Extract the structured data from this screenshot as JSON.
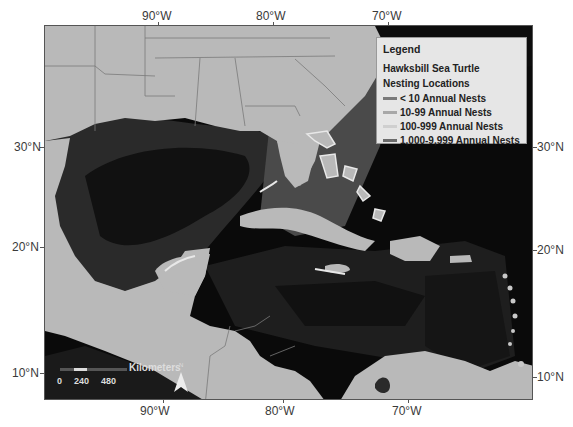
{
  "map": {
    "title": "Hawksbill Sea Turtle Nesting Locations",
    "colors": {
      "land": "#b9b9b9",
      "shallow_water": "#4a4a4a",
      "mid_water": "#2a2a2a",
      "deep_water": "#0a0a0a",
      "border": "#7a7a7a",
      "nest_highlight": "#e8e8e8"
    }
  },
  "axes": {
    "top_labels": [
      {
        "label": "90°W",
        "x": 158
      },
      {
        "label": "80°W",
        "x": 273
      },
      {
        "label": "70°W",
        "x": 388
      }
    ],
    "bottom_labels": [
      {
        "label": "90°W",
        "x": 163
      },
      {
        "label": "80°W",
        "x": 283
      },
      {
        "label": "70°W",
        "x": 408
      }
    ],
    "left_labels": [
      {
        "label": "30°N",
        "y": 147
      },
      {
        "label": "20°N",
        "y": 247
      },
      {
        "label": "10°N",
        "y": 373
      }
    ],
    "right_labels": [
      {
        "label": "30°N",
        "y": 147
      },
      {
        "label": "20°N",
        "y": 250
      },
      {
        "label": "10°N",
        "y": 377
      }
    ]
  },
  "legend": {
    "heading": "Legend",
    "subtitle_line1": "Hawksbill Sea Turtle",
    "subtitle_line2": "Nesting Locations",
    "items": [
      {
        "label": "< 10 Annual Nests",
        "color": "#7a7a7a"
      },
      {
        "label": "10-99 Annual Nests",
        "color": "#a8a8a8"
      },
      {
        "label": "100-999 Annual Nests",
        "color": "#cfcfcf"
      },
      {
        "label": "1,000-9,999 Annual Nests",
        "color": "#6b6b6b"
      }
    ]
  },
  "scale_bar": {
    "unit": "Kilometers",
    "ticks": [
      "0",
      "240",
      "480"
    ]
  },
  "north_arrow": {
    "label": "N"
  }
}
